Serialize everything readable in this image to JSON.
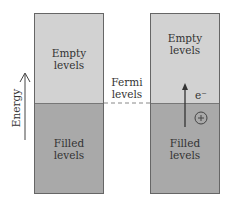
{
  "diagram": {
    "axis_label": "Energy",
    "fermi_label_line1": "Fermi",
    "fermi_label_line2": "levels",
    "left_panel": {
      "empty_line1": "Empty",
      "empty_line2": "levels",
      "filled_line1": "Filled",
      "filled_line2": "levels"
    },
    "right_panel": {
      "empty_line1": "Empty",
      "empty_line2": "levels",
      "filled_line1": "Filled",
      "filled_line2": "levels",
      "electron_label": "e⁻",
      "hole_symbol": "+"
    },
    "colors": {
      "empty_fill": "#d2d2d2",
      "filled_fill": "#a9a9a9",
      "line": "#444444"
    }
  }
}
